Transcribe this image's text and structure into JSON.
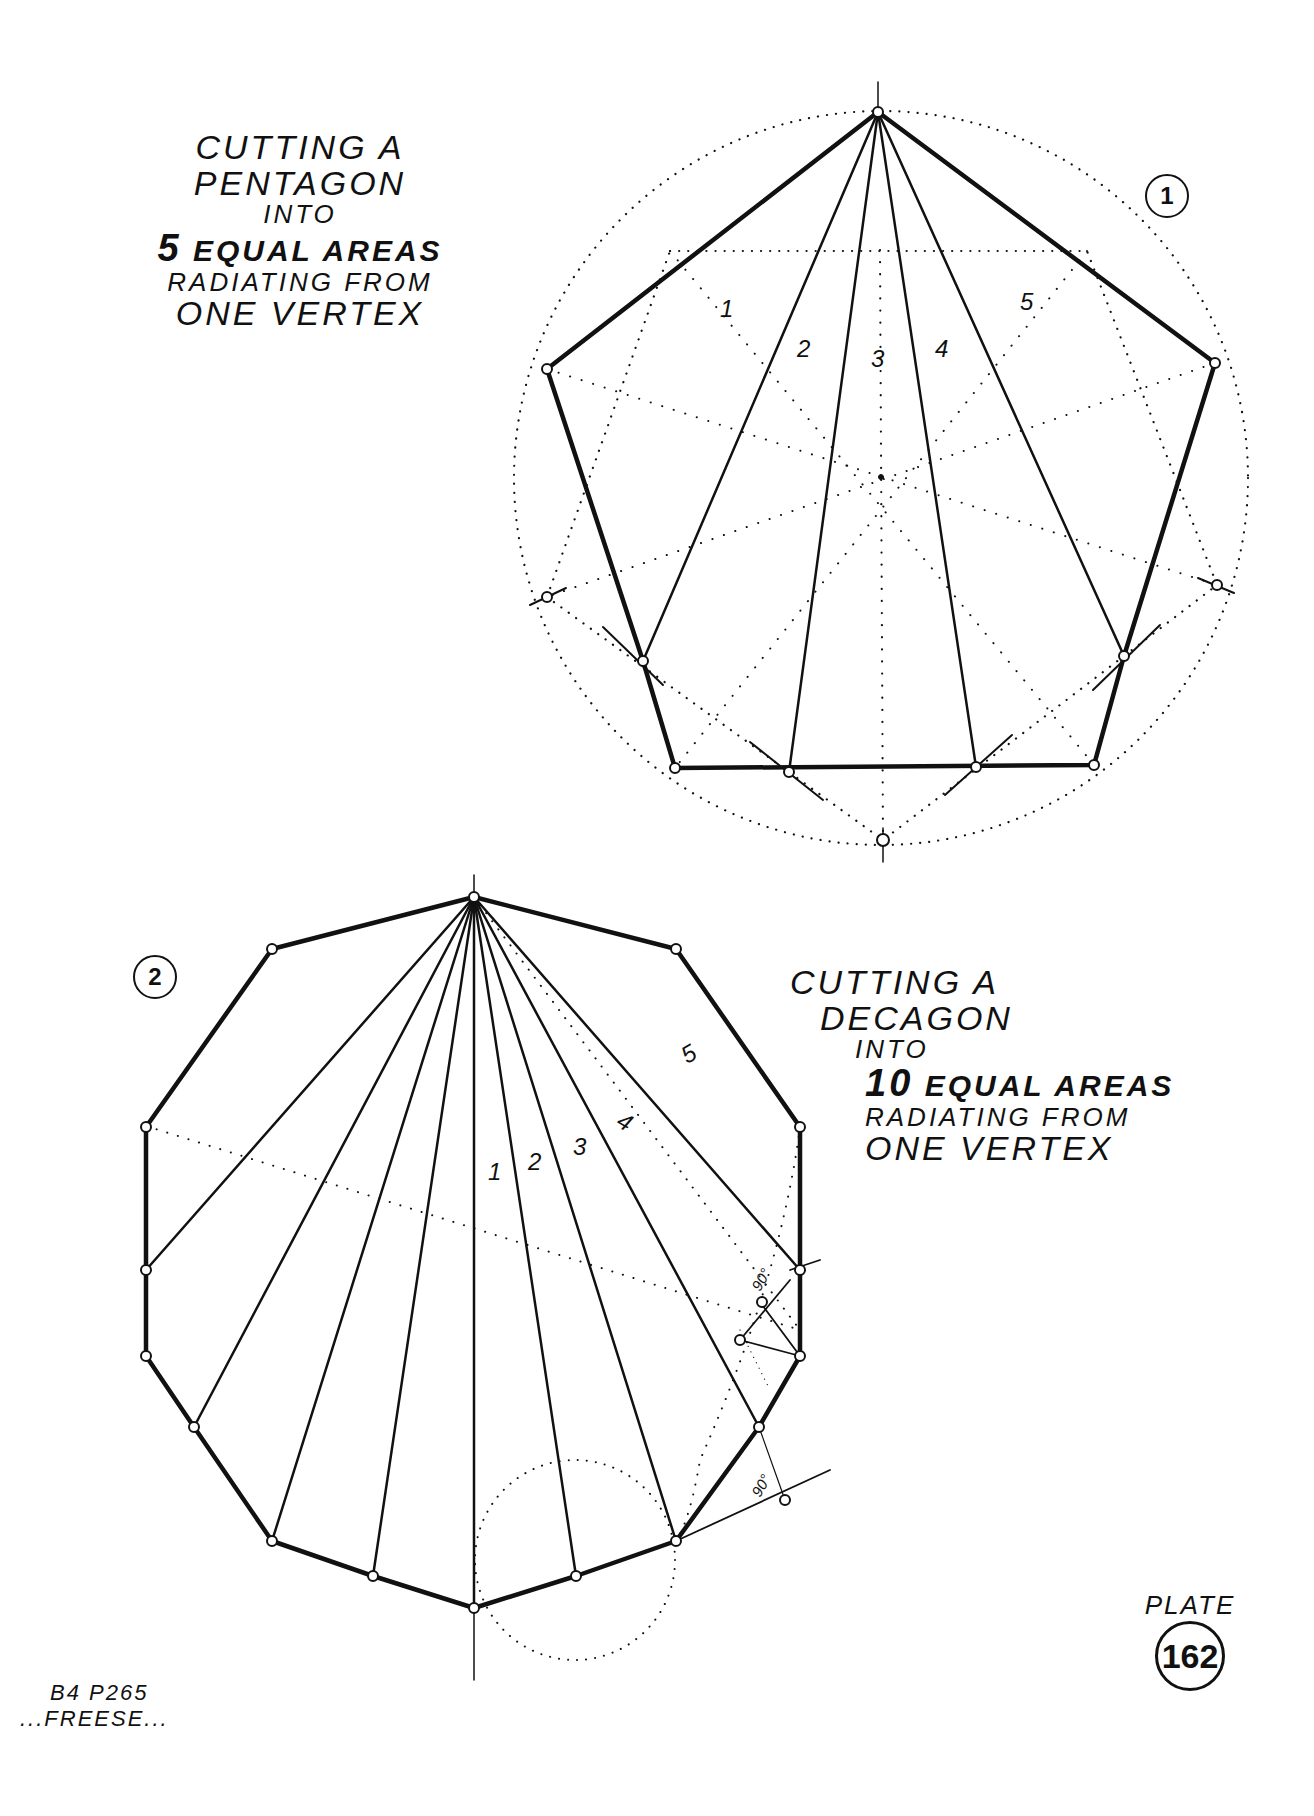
{
  "figure1": {
    "number": "1",
    "title_lines": [
      "CUTTING A",
      "PENTAGON",
      "INTO",
      "5 EQUAL AREAS",
      "RADIATING FROM",
      "ONE VERTEX"
    ],
    "title": {
      "line1": "CUTTING A",
      "line2": "PENTAGON",
      "line3": "INTO",
      "line4_num": "5",
      "line4_text": "EQUAL AREAS",
      "line5": "RADIATING FROM",
      "line6": "ONE VERTEX"
    },
    "area_labels": [
      "1",
      "2",
      "3",
      "4",
      "5"
    ]
  },
  "figure2": {
    "number": "2",
    "title": {
      "line1": "CUTTING A",
      "line2": "DECAGON",
      "line3": "INTO",
      "line4_num": "10",
      "line4_text": "EQUAL AREAS",
      "line5": "RADIATING FROM",
      "line6": "ONE VERTEX"
    },
    "area_labels": [
      "1",
      "2",
      "3",
      "4",
      "5"
    ],
    "angle_marks": [
      "90°",
      "90°"
    ]
  },
  "credit": {
    "line1": "B4 P265",
    "line2": "...FREESE..."
  },
  "plate": {
    "word": "PLATE",
    "number": "162"
  },
  "colors": {
    "ink": "#111111",
    "paper": "#ffffff"
  }
}
